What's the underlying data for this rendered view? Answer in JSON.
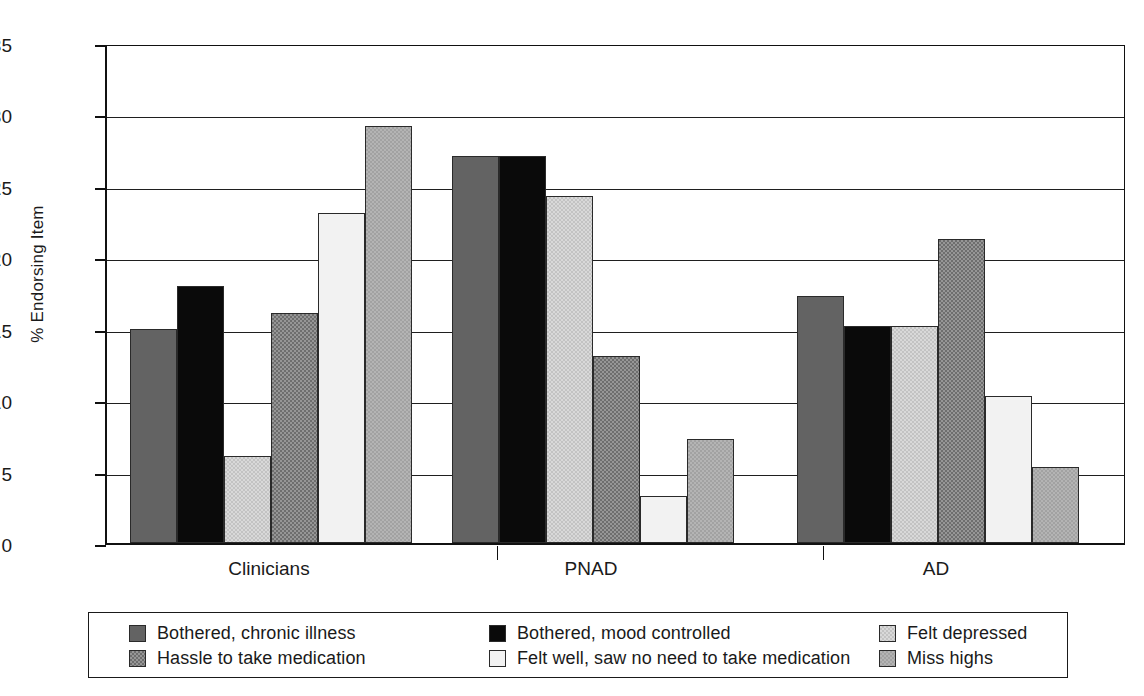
{
  "chart_data": {
    "type": "bar",
    "title": "",
    "xlabel": "",
    "ylabel": "% Endorsing Item",
    "ylim": [
      0,
      35
    ],
    "ytick_values": [
      0,
      5,
      10,
      15,
      20,
      25,
      30,
      35
    ],
    "ytick_labels": [
      "0",
      "5",
      "10",
      "15",
      "20",
      "25",
      "30",
      "35"
    ],
    "grid": true,
    "legend_position": "bottom",
    "categories": [
      "Clinicians",
      "PNAD",
      "AD"
    ],
    "series": [
      {
        "name": "Bothered, chronic illness",
        "key": "bothered-chronic",
        "color": "#636363",
        "values": [
          15.0,
          27.1,
          17.3
        ]
      },
      {
        "name": "Bothered, mood controlled",
        "key": "bothered-mood",
        "color": "#0a0a0a",
        "values": [
          18.0,
          27.1,
          15.2
        ]
      },
      {
        "name": "Felt depressed",
        "key": "felt-depressed",
        "color": "#d9d9d9",
        "values": [
          6.1,
          24.3,
          15.2
        ]
      },
      {
        "name": "Hassle to take medication",
        "key": "hassle",
        "color": "#6e6e6e",
        "values": [
          16.1,
          13.1,
          21.3
        ]
      },
      {
        "name": "Felt well, saw no need to take medication",
        "key": "felt-well",
        "color": "#f2f2f2",
        "values": [
          23.1,
          3.3,
          10.3
        ]
      },
      {
        "name": "Miss highs",
        "key": "miss-highs",
        "color": "#b4b4b4",
        "values": [
          29.2,
          7.3,
          5.3
        ]
      }
    ]
  },
  "legend": {
    "columns": [
      [
        {
          "label": "Bothered, chronic illness",
          "key": "bothered-chronic"
        },
        {
          "label": "Hassle to take medication",
          "key": "hassle"
        }
      ],
      [
        {
          "label": "Bothered, mood controlled",
          "key": "bothered-mood"
        },
        {
          "label": "Felt well, saw no need to take medication",
          "key": "felt-well"
        }
      ],
      [
        {
          "label": "Felt depressed",
          "key": "felt-depressed"
        },
        {
          "label": "Miss highs",
          "key": "miss-highs"
        }
      ]
    ]
  }
}
